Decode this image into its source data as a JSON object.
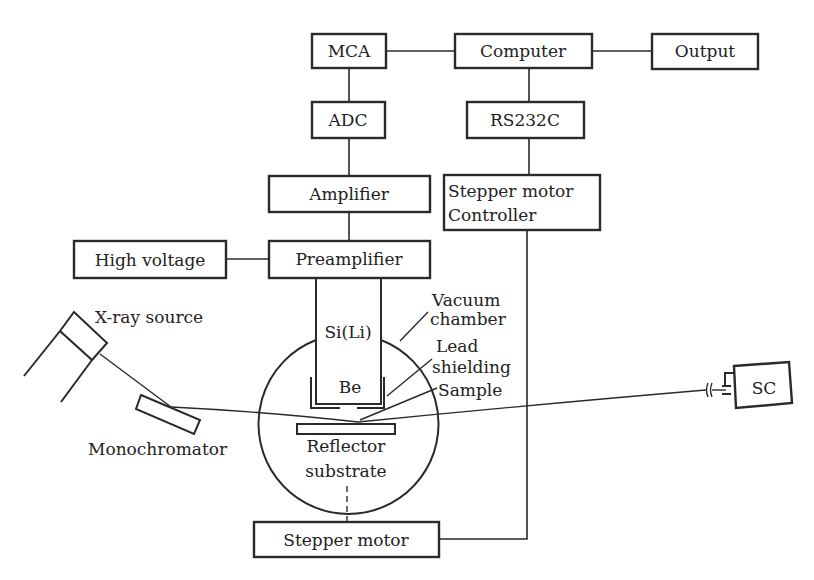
{
  "diagram": {
    "title": "",
    "colors": {
      "line": "#2a2a2a",
      "text": "#222222",
      "background": "#ffffff"
    },
    "blocks": {
      "mca": "MCA",
      "computer": "Computer",
      "output": "Output",
      "adc": "ADC",
      "rs232c": "RS232C",
      "amplifier": "Amplifier",
      "stepper_controller_line1": "Stepper motor",
      "stepper_controller_line2": "Controller",
      "high_voltage": "High voltage",
      "preamplifier": "Preamplifier",
      "stepper_motor": "Stepper motor",
      "sc": "SC"
    },
    "labels": {
      "detector": "Si(Li)",
      "window": "Be",
      "xray_source": "X-ray source",
      "vacuum_chamber_line1": "Vacuum",
      "vacuum_chamber_line2": "chamber",
      "lead_shielding_line1": "Lead",
      "lead_shielding_line2": "shielding",
      "sample": "Sample",
      "monochromator": "Monochromator",
      "reflector_line1": "Reflector",
      "reflector_line2": "substrate"
    },
    "connections": [
      [
        "MCA",
        "Computer"
      ],
      [
        "Computer",
        "Output"
      ],
      [
        "MCA",
        "ADC"
      ],
      [
        "ADC",
        "Amplifier"
      ],
      [
        "Amplifier",
        "Preamplifier"
      ],
      [
        "High voltage",
        "Preamplifier"
      ],
      [
        "Preamplifier",
        "Si(Li)"
      ],
      [
        "Computer",
        "RS232C"
      ],
      [
        "RS232C",
        "Stepper motor Controller"
      ],
      [
        "Stepper motor Controller",
        "Stepper motor"
      ],
      [
        "Stepper motor",
        "Reflector substrate"
      ]
    ],
    "beam_path": [
      "X-ray source",
      "Monochromator",
      "Sample",
      "SC"
    ]
  }
}
